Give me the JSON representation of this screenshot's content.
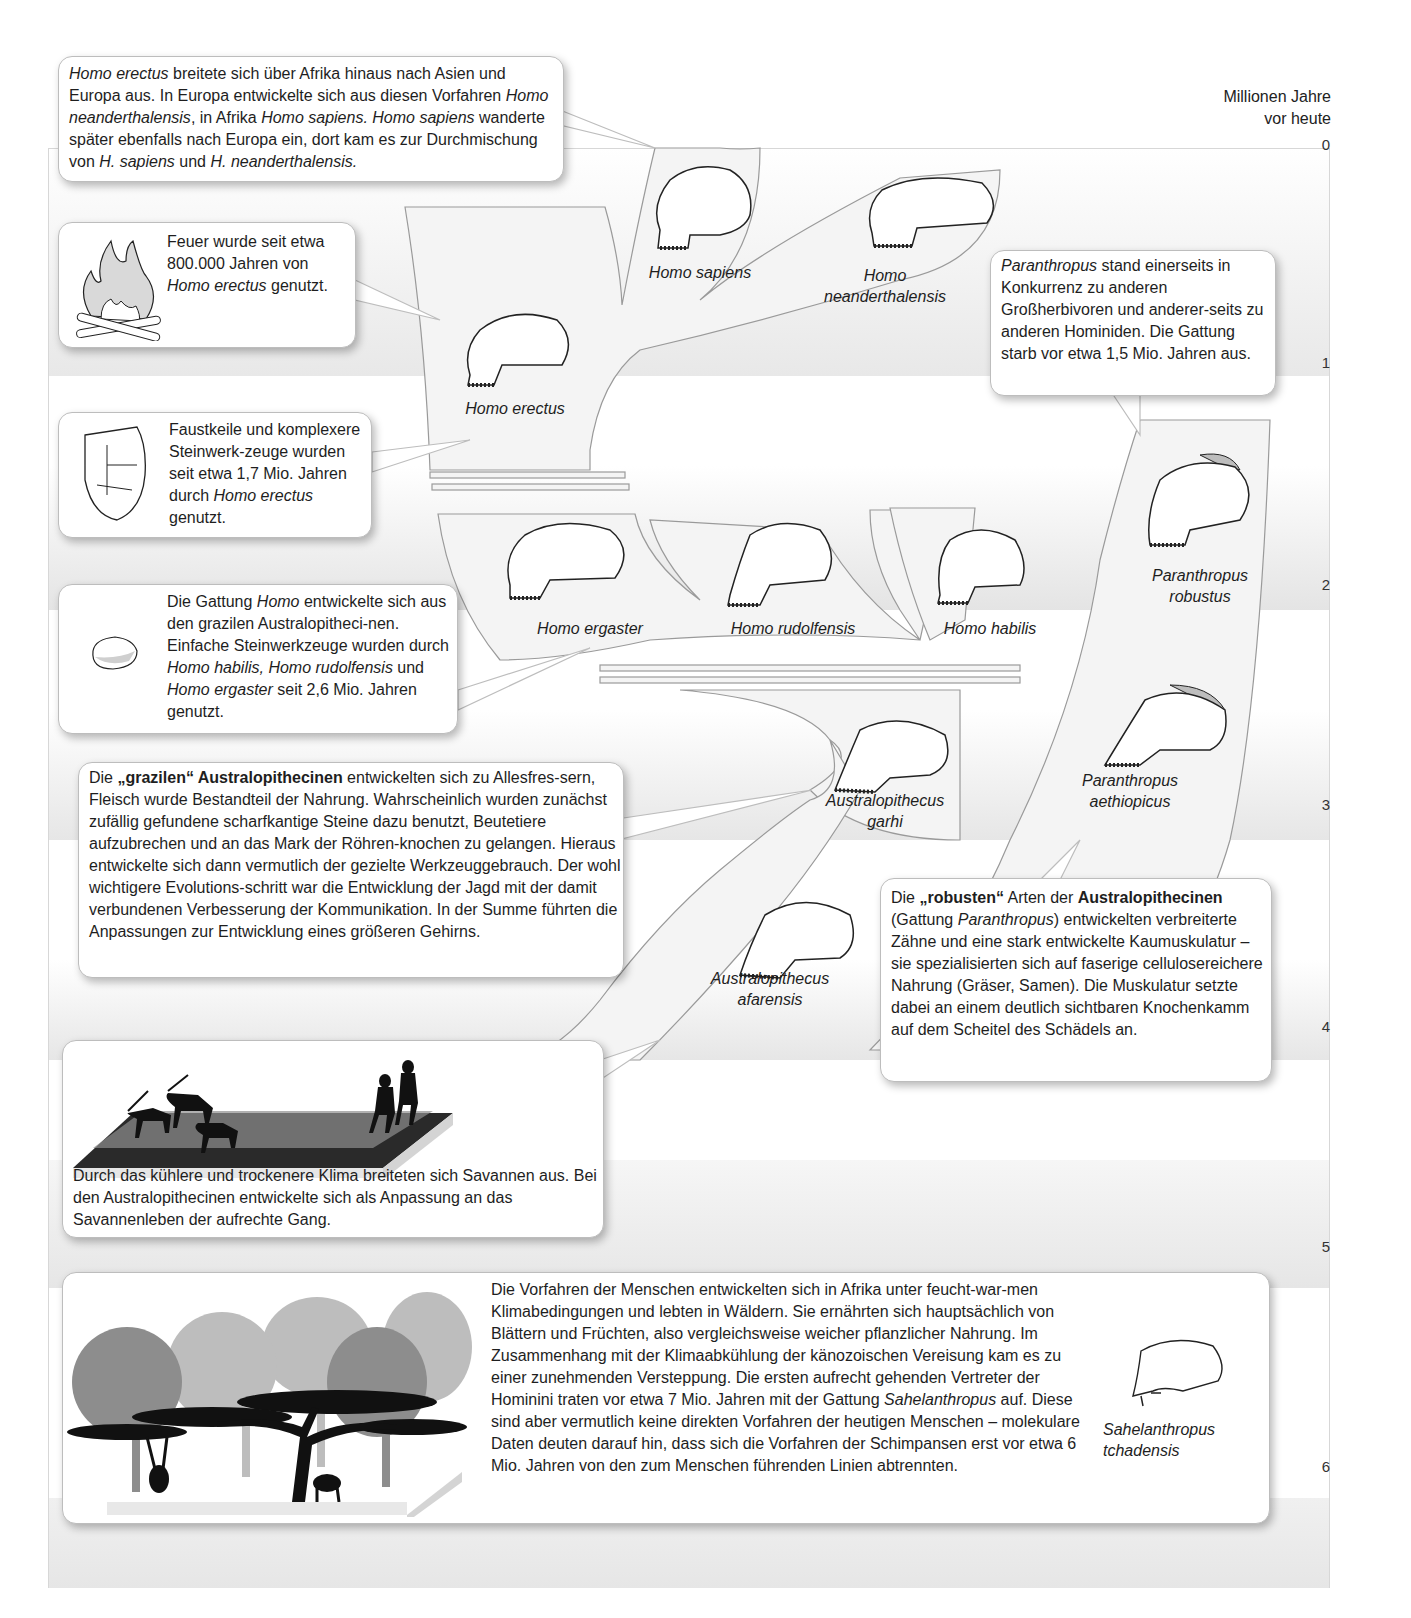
{
  "axis": {
    "title_line1": "Millionen Jahre",
    "title_line2": "vor heute",
    "ticks": [
      "0",
      "1",
      "2",
      "3",
      "4",
      "5",
      "6"
    ]
  },
  "species": {
    "homo_sapiens": "Homo sapiens",
    "homo_neanderthalensis_1": "Homo",
    "homo_neanderthalensis_2": "neanderthalensis",
    "homo_erectus": "Homo erectus",
    "homo_ergaster": "Homo ergaster",
    "homo_rudolfensis": "Homo rudolfensis",
    "homo_habilis": "Homo habilis",
    "paranthropus_robustus_1": "Paranthropus",
    "paranthropus_robustus_2": "robustus",
    "paranthropus_aethiopicus_1": "Paranthropus",
    "paranthropus_aethiopicus_2": "aethiopicus",
    "australopithecus_garhi_1": "Australopithecus",
    "australopithecus_garhi_2": "garhi",
    "australopithecus_afarensis_1": "Australopithecus",
    "australopithecus_afarensis_2": "afarensis",
    "sahelanthropus_1": "Sahelanthropus",
    "sahelanthropus_2": "tchadensis"
  },
  "boxes": {
    "erectus_spread": {
      "it1": "Homo erectus",
      "t1": " breitete sich über Afrika hinaus nach Asien und Europa aus. In Europa entwickelte sich aus diesen Vorfahren ",
      "it2": "Homo neanderthalensis",
      "t2": ", in Afrika ",
      "it3": "Homo sapiens. Homo sapiens",
      "t3": " wanderte später ebenfalls nach Europa ein, dort kam es zur Durchmischung von ",
      "it4": "H. sapiens",
      "t4": " und ",
      "it5": "H. neanderthalensis."
    },
    "fire": {
      "t1": "Feuer wurde seit etwa 800.000 Jahren von ",
      "it1": "Homo erectus",
      "t2": " genutzt."
    },
    "handaxe": {
      "t1": "Faustkeile und komplexere Steinwerk-zeuge wurden seit etwa 1,7 Mio. Jahren durch ",
      "it1": "Homo erectus",
      "t2": " genutzt."
    },
    "genus_homo": {
      "t1": "Die Gattung ",
      "it1": "Homo",
      "t2": " entwickelte sich aus den grazilen Australopitheci-nen. Einfache Steinwerkzeuge wurden durch ",
      "it2": "Homo habilis, Homo rudolfensis",
      "t3": " und ",
      "it3": "Homo ergaster",
      "t4": " seit 2,6 Mio. Jahren genutzt."
    },
    "paranthropus_competition": {
      "it1": "Paranthropus",
      "t1": " stand einerseits in Konkurrenz zu anderen Großherbivoren und anderer-seits zu anderen Hominiden. Die Gattung starb vor etwa 1,5 Mio. Jahren aus."
    },
    "gracile": {
      "t1": "Die ",
      "b1": "„grazilen“ Australopithecinen",
      "t2": " entwickelten sich zu Allesfres-sern, Fleisch wurde Bestandteil der Nahrung. Wahrscheinlich wurden zunächst zufällig gefundene scharfkantige Steine dazu benutzt, Beutetiere aufzubrechen und an das Mark der Röhren-knochen zu gelangen. Hieraus entwickelte sich dann vermutlich der gezielte Werkzeuggebrauch. Der wohl wichtigere Evolutions-schritt war die Entwicklung der Jagd mit der damit verbundenen Verbesserung der Kommunikation. In der Summe führten die Anpassungen zur Entwicklung eines größeren Gehirns."
    },
    "robust": {
      "t1": "Die ",
      "b1": "„robusten“",
      "t2": " Arten der ",
      "b2": "Australopithecinen",
      "t3": " (Gattung ",
      "it1": "Paranthropus",
      "t4": ") entwickelten verbreiterte Zähne und eine stark entwickelte Kaumuskulatur – sie spezialisierten sich auf faserige cellulosereichere Nahrung (Gräser, Samen). Die Muskulatur setzte dabei an einem deutlich sichtbaren Knochenkamm auf dem Scheitel des Schädels an."
    },
    "savanna": {
      "t1": "Durch das kühlere und trockenere Klima breiteten sich Savannen aus. Bei den Australopithecinen entwickelte sich als Anpassung an das Savannenleben der aufrechte Gang."
    },
    "forest": {
      "t1": "Die Vorfahren der Menschen entwickelten sich in Afrika unter feucht-war-men Klimabedingungen und lebten in Wäldern. Sie ernährten sich hauptsächlich von Blättern und Früchten, also vergleichsweise weicher pflanzlicher Nahrung. Im Zusammenhang mit der Klimaabkühlung der känozoischen Vereisung kam es zu einer zunehmenden Versteppung. Die ersten aufrecht gehenden Vertreter der Hominini traten vor etwa 7 Mio. Jahren mit der Gattung ",
      "it1": "Sahelanthropus",
      "t2": " auf. Diese sind aber vermutlich keine direkten Vorfahren der heutigen Menschen – molekulare Daten deuten darauf hin, dass sich die Vorfahren der Schimpansen erst vor etwa 6 Mio. Jahren von den zum Menschen führenden Linien abtrennten."
    }
  },
  "colors": {
    "branch_fill": "#f3f3f3",
    "branch_stroke": "#9a9a9a",
    "band_gray": "#e6e6e6",
    "crest_gray": "#bdbdbd"
  }
}
